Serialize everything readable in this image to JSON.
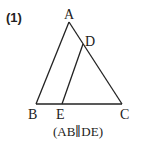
{
  "problem": {
    "number": "(1)",
    "caption": "(AB∥DE)"
  },
  "figure": {
    "points": {
      "A": {
        "label": "A",
        "x": 69,
        "y": 22
      },
      "B": {
        "label": "B",
        "x": 36,
        "y": 104
      },
      "C": {
        "label": "C",
        "x": 122,
        "y": 104
      },
      "D": {
        "label": "D",
        "x": 83,
        "y": 45
      },
      "E": {
        "label": "E",
        "x": 62,
        "y": 104
      }
    },
    "segments": [
      "AB",
      "AC",
      "BC",
      "DE"
    ],
    "stroke_color": "#222222"
  }
}
